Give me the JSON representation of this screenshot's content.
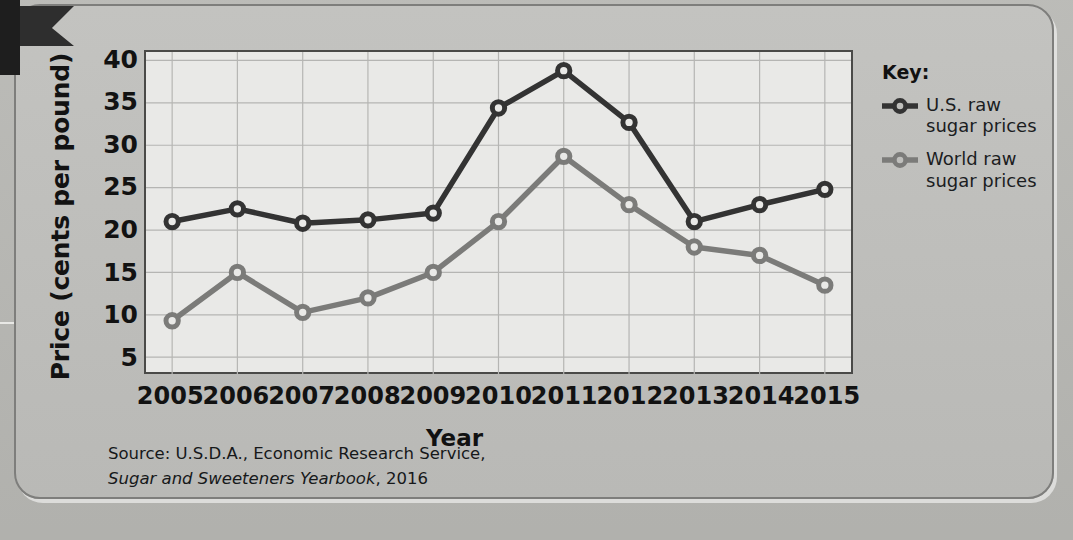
{
  "chart_data": {
    "type": "line",
    "title": "",
    "xlabel": "Year",
    "ylabel": "Price (cents per pound)",
    "categories": [
      "2005",
      "2006",
      "2007",
      "2008",
      "2009",
      "2010",
      "2011",
      "2012",
      "2013",
      "2014",
      "2015"
    ],
    "x": [
      2005,
      2006,
      2007,
      2008,
      2009,
      2010,
      2011,
      2012,
      2013,
      2014,
      2015
    ],
    "xlim": [
      2004.6,
      2015.4
    ],
    "ylim": [
      3,
      41
    ],
    "ytick_labels": [
      "40",
      "35",
      "30",
      "25",
      "20",
      "15",
      "10",
      "5"
    ],
    "yticks": [
      40,
      35,
      30,
      25,
      20,
      15,
      10,
      5
    ],
    "grid": true,
    "legend_position": "right",
    "series": [
      {
        "name": "U.S. raw sugar prices",
        "color": "#333333",
        "values": [
          21.0,
          22.5,
          20.8,
          21.2,
          22.0,
          34.4,
          38.8,
          32.7,
          21.0,
          23.0,
          24.8
        ]
      },
      {
        "name": "World raw sugar prices",
        "color": "#7b7b79",
        "values": [
          9.3,
          15.0,
          10.3,
          12.0,
          15.0,
          21.0,
          28.7,
          23.0,
          18.0,
          17.0,
          13.5
        ]
      }
    ]
  },
  "legend": {
    "title": "Key:",
    "entries": [
      {
        "label_line1": "U.S. raw",
        "label_line2": "sugar prices",
        "color": "#333333"
      },
      {
        "label_line1": "World raw",
        "label_line2": "sugar prices",
        "color": "#7b7b79"
      }
    ]
  },
  "source_note": {
    "line1": "Source: U.S.D.A., Economic Research Service,",
    "line2_italic": "Sugar and Sweeteners Yearbook",
    "line2_rest": ", 2016"
  },
  "background_ghost_text": {
    "line1": "a larger",
    "line2": "foundation"
  },
  "colors": {
    "us_series": "#333333",
    "world_series": "#7b7b79",
    "plot_background": "#e9e9e7",
    "card_background": "#bfbfbc",
    "frame": "#4a4a48",
    "grid": "#b5b5b3",
    "text": "#111111"
  }
}
